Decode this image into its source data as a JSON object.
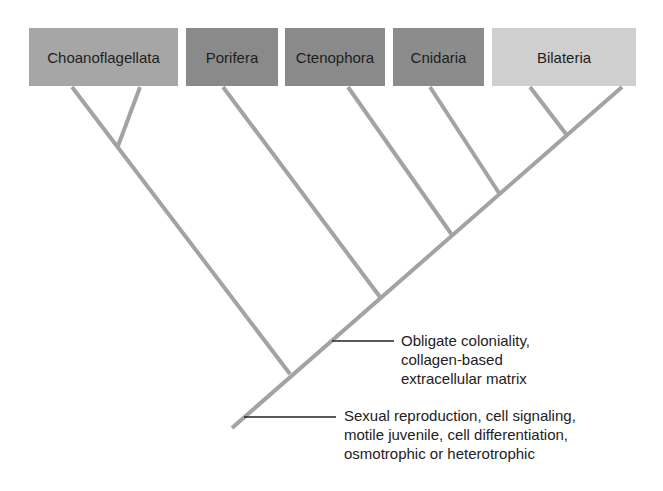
{
  "diagram": {
    "type": "cladogram",
    "taxa": [
      {
        "name": "Choanoflagellata",
        "color": "#a6a6a6",
        "x": 29,
        "w": 149
      },
      {
        "name": "Porifera",
        "color": "#8a8a8a",
        "x": 186,
        "w": 92
      },
      {
        "name": "Ctenophora",
        "color": "#8a8a8a",
        "x": 285,
        "w": 100
      },
      {
        "name": "Cnidaria",
        "color": "#8c8c8c",
        "x": 393,
        "w": 91
      },
      {
        "name": "Bilateria",
        "color": "#cfcfcf",
        "x": 492,
        "w": 144
      }
    ],
    "branch_color": "#a3a3a3",
    "annotations": [
      {
        "id": "animal-node",
        "lines": [
          "Obligate coloniality,",
          "collagen-based",
          "extracellular matrix"
        ]
      },
      {
        "id": "root-node",
        "lines": [
          "Sexual reproduction, cell signaling,",
          "motile juvenile, cell differentiation,",
          "osmotrophic or heterotrophic"
        ]
      }
    ]
  }
}
